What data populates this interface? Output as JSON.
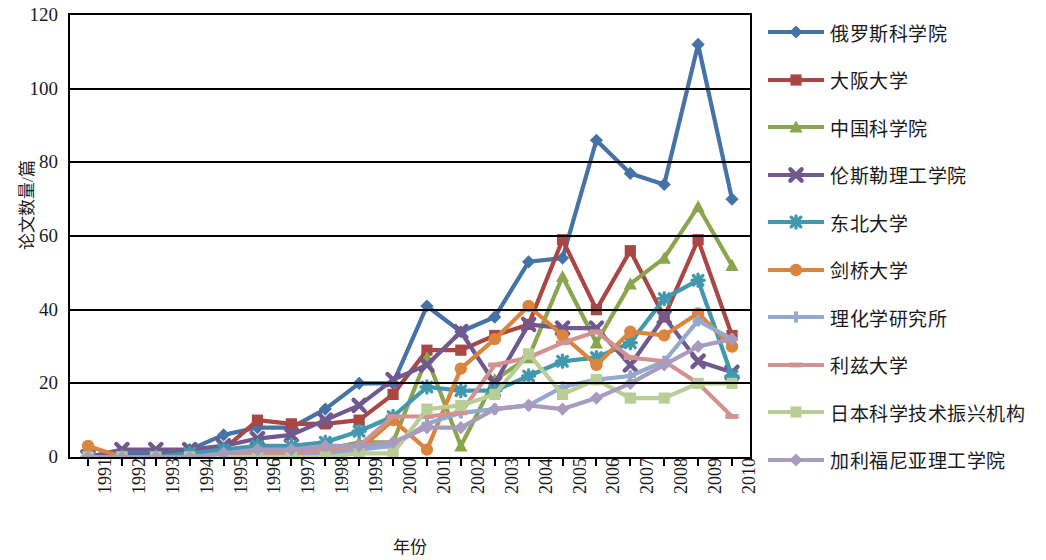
{
  "chart_data": {
    "type": "line",
    "title": "",
    "xlabel": "年份",
    "ylabel": "论文数量/篇",
    "ylim": [
      0,
      120
    ],
    "ytick_step": 20,
    "yticks": [
      "0",
      "20",
      "40",
      "60",
      "80",
      "100",
      "120"
    ],
    "grid": true,
    "legend_position": "right",
    "categories": [
      "1991",
      "1992",
      "1993",
      "1994",
      "1995",
      "1996",
      "1997",
      "1998",
      "1999",
      "2000",
      "2001",
      "2002",
      "2003",
      "2004",
      "2005",
      "2006",
      "2007",
      "2008",
      "2009",
      "2010"
    ],
    "series": [
      {
        "name": "俄罗斯科学院",
        "color": "#4572A7",
        "marker": "diamond",
        "values": [
          0,
          1,
          1,
          2,
          6,
          8,
          8,
          13,
          20,
          20,
          41,
          34,
          38,
          53,
          54,
          86,
          77,
          74,
          112,
          70
        ]
      },
      {
        "name": "大阪大学",
        "color": "#AA4643",
        "marker": "square",
        "values": [
          0,
          0,
          0,
          1,
          2,
          10,
          9,
          9,
          10,
          17,
          29,
          29,
          33,
          36,
          59,
          40,
          56,
          38,
          59,
          33
        ]
      },
      {
        "name": "中国科学院",
        "color": "#89A54E",
        "marker": "triangle",
        "values": [
          0,
          0,
          0,
          0,
          0,
          1,
          1,
          2,
          4,
          4,
          27,
          3,
          21,
          27,
          49,
          31,
          47,
          54,
          68,
          52
        ]
      },
      {
        "name": "伦斯勒理工学院",
        "color": "#71588F",
        "marker": "x",
        "values": [
          0,
          2,
          2,
          2,
          3,
          5,
          6,
          10,
          14,
          21,
          25,
          34,
          20,
          36,
          35,
          35,
          25,
          38,
          26,
          23
        ]
      },
      {
        "name": "东北大学",
        "color": "#4198AF",
        "marker": "star",
        "values": [
          0,
          0,
          0,
          1,
          2,
          3,
          3,
          4,
          7,
          11,
          19,
          18,
          18,
          22,
          26,
          27,
          31,
          43,
          48,
          22
        ]
      },
      {
        "name": "剑桥大学",
        "color": "#DB843D",
        "marker": "circle",
        "values": [
          3,
          0,
          0,
          0,
          0,
          1,
          1,
          1,
          2,
          10,
          2,
          24,
          32,
          41,
          33,
          25,
          34,
          33,
          39,
          30
        ]
      },
      {
        "name": "理化学研究所",
        "color": "#93A9CF",
        "marker": "plus",
        "values": [
          0,
          0,
          0,
          0,
          0,
          1,
          1,
          1,
          2,
          3,
          9,
          12,
          13,
          14,
          19,
          21,
          22,
          26,
          37,
          32
        ]
      },
      {
        "name": "利兹大学",
        "color": "#D19392",
        "marker": "dash",
        "values": [
          0,
          0,
          0,
          0,
          0,
          1,
          1,
          2,
          3,
          11,
          11,
          12,
          25,
          27,
          31,
          34,
          27,
          26,
          20,
          11
        ]
      },
      {
        "name": "日本科学技术振兴机构",
        "color": "#B9CD96",
        "marker": "square",
        "values": [
          0,
          0,
          0,
          0,
          0,
          0,
          0,
          0,
          1,
          1,
          13,
          14,
          17,
          28,
          17,
          21,
          16,
          16,
          20,
          20
        ]
      },
      {
        "name": "加利福尼亚理工学院",
        "color": "#A99BBD",
        "marker": "diamond",
        "values": [
          0,
          0,
          0,
          0,
          1,
          2,
          2,
          3,
          3,
          4,
          8,
          8,
          13,
          14,
          13,
          16,
          20,
          25,
          30,
          32
        ]
      }
    ]
  }
}
